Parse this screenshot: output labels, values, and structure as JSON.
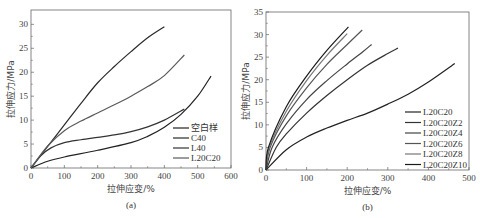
{
  "chart_data": [
    {
      "type": "line",
      "panel": "(a)",
      "caption": "(a)",
      "xlabel": "拉伸应变/%",
      "ylabel": "拉伸应力/MPa",
      "xlim": [
        0,
        600
      ],
      "ylim": [
        0,
        33
      ],
      "xticks": [
        0,
        100,
        200,
        300,
        400,
        500,
        600
      ],
      "yticks": [
        0,
        5,
        10,
        15,
        20,
        25,
        30
      ],
      "grid": false,
      "legend_position": "lower right",
      "box": {
        "x0": 31,
        "x1": 231,
        "y0": 168,
        "ytop": 10,
        "ymax": 33
      },
      "legend": {
        "x": 173,
        "y": 128,
        "dy": 10
      },
      "series": [
        {
          "name": "空白样",
          "color": "#222222",
          "points": [
            [
              0,
              0
            ],
            [
              50,
              1.4
            ],
            [
              100,
              2.3
            ],
            [
              200,
              3.7
            ],
            [
              300,
              5.3
            ],
            [
              350,
              6.6
            ],
            [
              400,
              8.5
            ],
            [
              450,
              11.2
            ],
            [
              500,
              15.0
            ],
            [
              540,
              19.2
            ]
          ]
        },
        {
          "name": "C40",
          "color": "#2a2a2a",
          "points": [
            [
              0,
              0
            ],
            [
              50,
              4.5
            ],
            [
              100,
              9.0
            ],
            [
              150,
              13.5
            ],
            [
              200,
              17.8
            ],
            [
              250,
              21.2
            ],
            [
              300,
              24.3
            ],
            [
              350,
              27.2
            ],
            [
              400,
              29.5
            ]
          ]
        },
        {
          "name": "L40",
          "color": "#333333",
          "points": [
            [
              0,
              0
            ],
            [
              30,
              2.6
            ],
            [
              60,
              4.2
            ],
            [
              100,
              5.3
            ],
            [
              150,
              5.9
            ],
            [
              200,
              6.4
            ],
            [
              250,
              6.9
            ],
            [
              300,
              7.6
            ],
            [
              350,
              8.6
            ],
            [
              400,
              10.0
            ],
            [
              460,
              12.3
            ]
          ]
        },
        {
          "name": "L20C20",
          "color": "#5a5a5a",
          "points": [
            [
              0,
              0
            ],
            [
              50,
              4.6
            ],
            [
              100,
              7.8
            ],
            [
              150,
              9.8
            ],
            [
              200,
              11.5
            ],
            [
              250,
              13.2
            ],
            [
              300,
              15.0
            ],
            [
              350,
              17.0
            ],
            [
              400,
              19.3
            ],
            [
              460,
              23.6
            ]
          ]
        }
      ]
    },
    {
      "type": "line",
      "panel": "(b)",
      "caption": "(b)",
      "xlabel": "拉伸应变/%",
      "ylabel": "拉伸应力/MPa",
      "xlim": [
        0,
        500
      ],
      "ylim": [
        0,
        35
      ],
      "xticks": [
        0,
        100,
        200,
        300,
        400,
        500
      ],
      "yticks": [
        0,
        5,
        10,
        15,
        20,
        25,
        30,
        35
      ],
      "grid": false,
      "legend_position": "lower right",
      "box": {
        "x0": 266,
        "x1": 469,
        "y0": 170,
        "ytop": 12,
        "ymax": 35
      },
      "legend": {
        "x": 405,
        "y": 112,
        "dy": 10.5
      },
      "series": [
        {
          "name": "L20C20",
          "color": "#222222",
          "points": [
            [
              0,
              0
            ],
            [
              50,
              4.5
            ],
            [
              100,
              7.3
            ],
            [
              150,
              9.3
            ],
            [
              200,
              11.0
            ],
            [
              250,
              12.6
            ],
            [
              300,
              14.6
            ],
            [
              350,
              16.8
            ],
            [
              400,
              19.5
            ],
            [
              465,
              23.6
            ]
          ]
        },
        {
          "name": "L20C20Z2",
          "color": "#333333",
          "points": [
            [
              0,
              0
            ],
            [
              25,
              5.0
            ],
            [
              50,
              8.0
            ],
            [
              100,
              12.6
            ],
            [
              150,
              16.5
            ],
            [
              200,
              20.0
            ],
            [
              250,
              23.2
            ],
            [
              300,
              25.8
            ],
            [
              325,
              27.0
            ]
          ]
        },
        {
          "name": "L20C20Z4",
          "color": "#444444",
          "points": [
            [
              0,
              0
            ],
            [
              15,
              5.0
            ],
            [
              50,
              10.2
            ],
            [
              100,
              15.6
            ],
            [
              150,
              19.8
            ],
            [
              200,
              23.5
            ],
            [
              240,
              26.3
            ],
            [
              260,
              27.8
            ]
          ]
        },
        {
          "name": "L20C20Z6",
          "color": "#555555",
          "points": [
            [
              0,
              0
            ],
            [
              10,
              5.0
            ],
            [
              50,
              12.0
            ],
            [
              100,
              18.2
            ],
            [
              150,
              23.4
            ],
            [
              200,
              27.8
            ],
            [
              237,
              31.0
            ]
          ]
        },
        {
          "name": "L20C20Z8",
          "color": "#777777",
          "points": [
            [
              0,
              0
            ],
            [
              8,
              5.0
            ],
            [
              50,
              13.0
            ],
            [
              100,
              19.8
            ],
            [
              150,
              25.4
            ],
            [
              200,
              30.2
            ]
          ]
        },
        {
          "name": "L20C20Z10",
          "color": "#1a1a1a",
          "points": [
            [
              0,
              0
            ],
            [
              6,
              5.0
            ],
            [
              50,
              14.0
            ],
            [
              100,
              20.8
            ],
            [
              150,
              26.5
            ],
            [
              203,
              31.7
            ]
          ]
        }
      ]
    }
  ]
}
